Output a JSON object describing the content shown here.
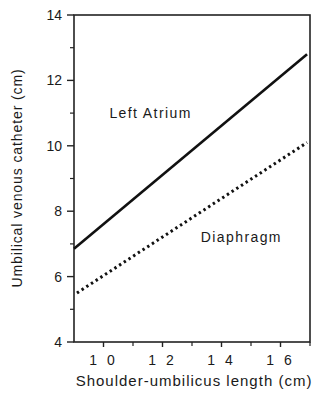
{
  "chart_data": {
    "type": "line",
    "title": "",
    "xlabel": "Shoulder-umbilicus length (cm)",
    "ylabel": "Umbilical venous catheter (cm)",
    "xlim": [
      9,
      17
    ],
    "ylim": [
      4,
      14
    ],
    "x_ticks": [
      10,
      12,
      14,
      16
    ],
    "x_tick_labels": [
      "1 0",
      "1 2",
      "1 4",
      "1 6"
    ],
    "x_minor_ticks": [
      11,
      13,
      15,
      17
    ],
    "y_ticks": [
      4,
      6,
      8,
      10,
      12,
      14
    ],
    "y_tick_labels": [
      "4",
      "6",
      "8",
      "10",
      "12",
      "14"
    ],
    "y_minor_ticks": [
      5,
      7,
      9,
      11,
      13
    ],
    "grid": false,
    "legend": "none (inline annotations)",
    "series": [
      {
        "name": "Left Atrium",
        "style": "solid",
        "x": [
          9,
          16.9
        ],
        "y": [
          6.85,
          12.8
        ]
      },
      {
        "name": "Diaphragm",
        "style": "dotted",
        "x": [
          9.1,
          16.9
        ],
        "y": [
          5.5,
          10.1
        ]
      }
    ],
    "annotations": [
      {
        "text": "Left Atrium",
        "x": 10.2,
        "y": 11.0
      },
      {
        "text": "Diaphragm",
        "x": 13.3,
        "y": 7.2
      }
    ]
  }
}
